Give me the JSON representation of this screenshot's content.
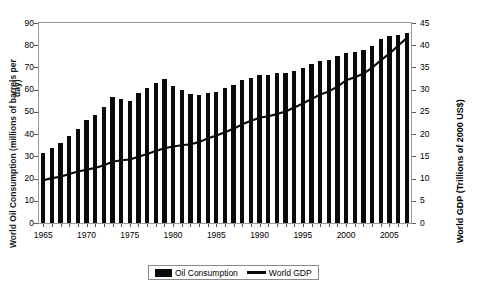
{
  "chart_data": {
    "type": "bar",
    "title": "",
    "xlabel": "",
    "ylabel": "World Oil Consumption (millions of barrels per",
    "ylabel_line2": "day)",
    "ylabel_right": "World GDP (Trillions of 2000 US$)",
    "ylim": [
      0,
      90
    ],
    "ylim_right": [
      0,
      45
    ],
    "ytick_step": 10,
    "ytick_step_right": 5,
    "grid": false,
    "legend_position": "bottom-center",
    "x": [
      1965,
      1966,
      1967,
      1968,
      1969,
      1970,
      1971,
      1972,
      1973,
      1974,
      1975,
      1976,
      1977,
      1978,
      1979,
      1980,
      1981,
      1982,
      1983,
      1984,
      1985,
      1986,
      1987,
      1988,
      1989,
      1990,
      1991,
      1992,
      1993,
      1994,
      1995,
      1996,
      1997,
      1998,
      1999,
      2000,
      2001,
      2002,
      2003,
      2004,
      2005,
      2006,
      2007
    ],
    "xtick_labels": [
      "1965",
      "1970",
      "1975",
      "1980",
      "1985",
      "1990",
      "1995",
      "2000",
      "2005"
    ],
    "xtick_values": [
      1965,
      1970,
      1975,
      1980,
      1985,
      1990,
      1995,
      2000,
      2005
    ],
    "yticks": [
      0,
      10,
      20,
      30,
      40,
      50,
      60,
      70,
      80,
      90
    ],
    "yticks_right": [
      0,
      5,
      10,
      15,
      20,
      25,
      30,
      35,
      40,
      45
    ],
    "series": [
      {
        "name": "Oil Consumption",
        "type": "bar",
        "axis": "left",
        "color": "#0a0a0a",
        "values": [
          31.3,
          33.6,
          36.0,
          39.1,
          42.5,
          46.2,
          48.6,
          52.3,
          56.6,
          55.7,
          55.0,
          58.7,
          60.8,
          63.1,
          64.8,
          61.6,
          59.8,
          58.1,
          57.6,
          58.6,
          58.9,
          60.6,
          62.0,
          64.2,
          65.2,
          66.4,
          66.8,
          67.3,
          67.3,
          68.5,
          69.7,
          71.4,
          72.9,
          73.3,
          75.1,
          76.4,
          77.1,
          77.9,
          79.7,
          82.7,
          84.0,
          84.8,
          85.6
        ]
      },
      {
        "name": "World GDP",
        "type": "line",
        "axis": "right",
        "color": "#0a0a0a",
        "values": [
          9.6,
          10.1,
          10.4,
          11.0,
          11.6,
          12.0,
          12.4,
          13.0,
          13.8,
          14.1,
          14.3,
          14.9,
          15.5,
          16.2,
          16.8,
          17.2,
          17.5,
          17.7,
          18.2,
          19.0,
          19.7,
          20.4,
          21.2,
          22.2,
          23.0,
          23.7,
          24.0,
          24.5,
          25.1,
          26.0,
          26.9,
          27.9,
          28.9,
          29.6,
          30.7,
          32.1,
          32.8,
          33.6,
          34.9,
          36.6,
          38.1,
          39.9,
          41.6
        ]
      }
    ]
  },
  "legend": {
    "items": [
      {
        "label": "Oil Consumption",
        "marker": "bar-swatch"
      },
      {
        "label": "World GDP",
        "marker": "line-swatch"
      }
    ]
  }
}
